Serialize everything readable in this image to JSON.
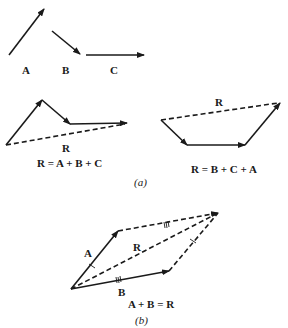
{
  "figure": {
    "part_a": {
      "vectors": [
        {
          "label": "A"
        },
        {
          "label": "B"
        },
        {
          "label": "C"
        }
      ],
      "left_sum": {
        "resultant_label": "R",
        "equation": "R = A + B + C"
      },
      "right_sum": {
        "resultant_label": "R",
        "equation": "R = B + C + A"
      },
      "caption": "(a)"
    },
    "part_b": {
      "labels": {
        "a": "A",
        "b": "B",
        "r": "R"
      },
      "equation": "A + B = R",
      "caption": "(b)"
    }
  }
}
